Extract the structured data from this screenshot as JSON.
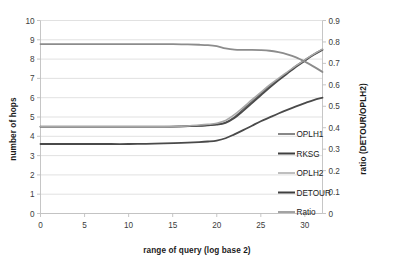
{
  "chart_data": {
    "type": "line",
    "title": "",
    "xlabel": "range of query (log base 2)",
    "ylabel": "number of hops",
    "ylabel_right": "ratio (DETOUR/OPLH2)",
    "xlim": [
      0,
      32
    ],
    "ylim": [
      0,
      10
    ],
    "ylim_right": [
      0,
      0.9
    ],
    "grid": true,
    "legend_position": "center-right-inside",
    "xticks": [
      0,
      5,
      10,
      15,
      20,
      25,
      30
    ],
    "xtick_labels": [
      "0",
      "5",
      "10",
      "15",
      "20",
      "25",
      "30"
    ],
    "yticks": [
      0,
      1,
      2,
      3,
      4,
      5,
      6,
      7,
      8,
      9,
      10
    ],
    "ytick_labels": [
      "0",
      "1",
      "2",
      "3",
      "4",
      "5",
      "6",
      "7",
      "8",
      "9",
      "10"
    ],
    "yticks_right": [
      0,
      0.1,
      0.2,
      0.3,
      0.4,
      0.5,
      0.6,
      0.7,
      0.8,
      0.9
    ],
    "ytick_labels_right": [
      "0",
      "0.1",
      "0.2",
      "0.3",
      "0.4",
      "0.5",
      "0.6",
      "0.7",
      "0.8",
      "0.9"
    ],
    "x": [
      0,
      2,
      4,
      6,
      8,
      10,
      12,
      14,
      16,
      18,
      19,
      20,
      21,
      22,
      23,
      24,
      25,
      26,
      27,
      28,
      29,
      30,
      31,
      32
    ],
    "series": [
      {
        "name": "OPLH1",
        "axis": "left",
        "color": "#6b6b6b",
        "width": 1.5,
        "values": [
          4.5,
          4.5,
          4.5,
          4.5,
          4.5,
          4.5,
          4.5,
          4.5,
          4.51,
          4.55,
          4.58,
          4.62,
          4.72,
          5.0,
          5.4,
          5.8,
          6.2,
          6.6,
          6.95,
          7.3,
          7.65,
          7.95,
          8.25,
          8.5
        ]
      },
      {
        "name": "RKSG",
        "axis": "left",
        "color": "#4a4a4a",
        "width": 1.8,
        "values": [
          4.5,
          4.5,
          4.5,
          4.5,
          4.5,
          4.5,
          4.5,
          4.5,
          4.51,
          4.54,
          4.57,
          4.6,
          4.7,
          4.95,
          5.32,
          5.72,
          6.12,
          6.52,
          6.9,
          7.25,
          7.6,
          7.92,
          8.22,
          8.48
        ]
      },
      {
        "name": "OPLH2",
        "axis": "left",
        "color": "#a8a8a8",
        "width": 1.5,
        "values": [
          4.5,
          4.5,
          4.5,
          4.5,
          4.5,
          4.5,
          4.5,
          4.5,
          4.52,
          4.58,
          4.62,
          4.68,
          4.82,
          5.12,
          5.5,
          5.9,
          6.28,
          6.66,
          7.0,
          7.33,
          7.66,
          7.96,
          8.26,
          8.52
        ]
      },
      {
        "name": "DETOUR",
        "axis": "left",
        "color": "#4a4a4a",
        "width": 1.8,
        "values": [
          3.6,
          3.6,
          3.6,
          3.6,
          3.6,
          3.6,
          3.61,
          3.63,
          3.66,
          3.7,
          3.73,
          3.78,
          3.9,
          4.1,
          4.32,
          4.55,
          4.78,
          4.98,
          5.18,
          5.37,
          5.55,
          5.72,
          5.88,
          6.0
        ]
      },
      {
        "name": "Ratio",
        "axis": "right",
        "color": "#8c8c8c",
        "width": 1.8,
        "values": [
          0.79,
          0.79,
          0.79,
          0.79,
          0.79,
          0.79,
          0.79,
          0.79,
          0.789,
          0.787,
          0.785,
          0.78,
          0.77,
          0.764,
          0.763,
          0.763,
          0.762,
          0.759,
          0.752,
          0.742,
          0.728,
          0.708,
          0.685,
          0.66
        ]
      }
    ],
    "legend": [
      {
        "label": "OPLH1",
        "color": "#6b6b6b",
        "width": 1.6
      },
      {
        "label": "RKSG",
        "color": "#3f3f3f",
        "width": 2.0
      },
      {
        "label": "OPLH2",
        "color": "#b0b0b0",
        "width": 1.6
      },
      {
        "label": "DETOUR",
        "color": "#3f3f3f",
        "width": 2.0
      },
      {
        "label": "Ratio",
        "color": "#8c8c8c",
        "width": 1.6
      }
    ],
    "colors": {
      "grid": "#d9d9d9",
      "axis": "#bfbfbf",
      "text": "#3c3c3c",
      "title_text": "#1a1a1a",
      "background": "#ffffff"
    }
  }
}
